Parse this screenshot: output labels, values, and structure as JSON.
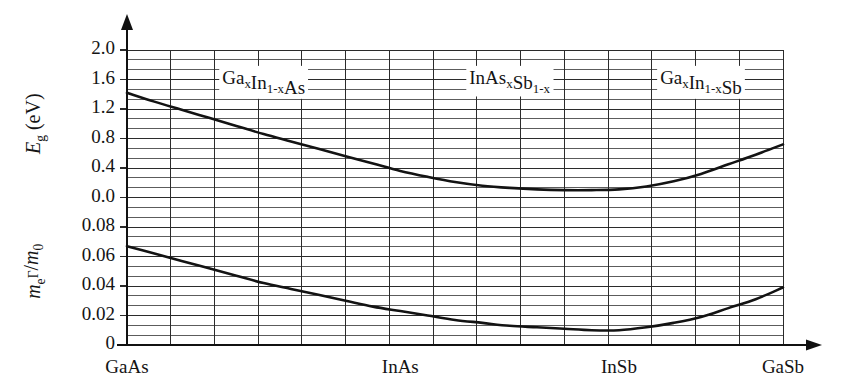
{
  "chart_data": {
    "type": "line",
    "title": "",
    "subtitle": "",
    "xlabel": "",
    "ylabel": "",
    "grid": true,
    "legend": "none",
    "x_axis": {
      "type": "composition",
      "tick_labels": [
        "GaAs",
        "InAs",
        "InSb",
        "GaSb"
      ],
      "tick_fractions": [
        0.0,
        0.4166,
        0.75,
        1.0
      ],
      "range": [
        0,
        1
      ]
    },
    "panels": [
      {
        "name": "bandgap",
        "ylabel_plain": "Eg (eV)",
        "ylabel_symbol": "E",
        "ylabel_subscript": "g",
        "ylabel_unit": "(eV)",
        "ytick_labels": [
          "2.0",
          "1.6",
          "1.2",
          "0.8",
          "0.4",
          "0.0"
        ],
        "ytick_values": [
          2.0,
          1.6,
          1.2,
          0.8,
          0.4,
          0.0
        ],
        "ylim": [
          0.0,
          2.0
        ],
        "minor_ticks_per_interval": 2,
        "series": [
          {
            "name": "Eg",
            "x": [
              0.0,
              0.0417,
              0.0833,
              0.125,
              0.1667,
              0.2083,
              0.25,
              0.2917,
              0.3333,
              0.375,
              0.4166,
              0.4583,
              0.5,
              0.5417,
              0.5833,
              0.625,
              0.6667,
              0.7083,
              0.75,
              0.7917,
              0.8333,
              0.875,
              0.9167,
              0.9583,
              1.0
            ],
            "values": [
              1.42,
              1.3,
              1.19,
              1.08,
              0.97,
              0.86,
              0.76,
              0.66,
              0.56,
              0.46,
              0.36,
              0.28,
              0.21,
              0.16,
              0.13,
              0.11,
              0.1,
              0.1,
              0.11,
              0.15,
              0.22,
              0.32,
              0.45,
              0.58,
              0.72
            ]
          }
        ]
      },
      {
        "name": "effective-mass",
        "ylabel_plain": "me(Gamma)/m0",
        "ylabel_symbol": "m",
        "ylabel_subscript": "e",
        "ylabel_superscript": "Γ",
        "ylabel_denominator": "m",
        "ylabel_denominator_subscript": "0",
        "ytick_labels": [
          "0.08",
          "0.06",
          "0.04",
          "0.02",
          "0"
        ],
        "ytick_values": [
          0.08,
          0.06,
          0.04,
          0.02,
          0.0
        ],
        "ylim": [
          0.0,
          0.1
        ],
        "minor_ticks_per_interval": 2,
        "series": [
          {
            "name": "me/m0",
            "x": [
              0.0,
              0.0417,
              0.0833,
              0.125,
              0.1667,
              0.2083,
              0.25,
              0.2917,
              0.3333,
              0.375,
              0.4166,
              0.4583,
              0.5,
              0.5417,
              0.5833,
              0.625,
              0.6667,
              0.7083,
              0.75,
              0.7917,
              0.8333,
              0.875,
              0.9167,
              0.9583,
              1.0
            ],
            "values": [
              0.067,
              0.062,
              0.057,
              0.052,
              0.047,
              0.042,
              0.038,
              0.034,
              0.03,
              0.026,
              0.023,
              0.02,
              0.017,
              0.015,
              0.013,
              0.012,
              0.011,
              0.01,
              0.01,
              0.012,
              0.015,
              0.019,
              0.025,
              0.031,
              0.039
            ]
          }
        ]
      }
    ],
    "annotations": [
      {
        "id": "alloy-1",
        "text": "GaxIn1-xAs",
        "parts": [
          {
            "t": "Ga",
            "k": "base"
          },
          {
            "t": "x",
            "k": "sub"
          },
          {
            "t": "In",
            "k": "base"
          },
          {
            "t": "1-x",
            "k": "sub"
          },
          {
            "t": "As",
            "k": "base"
          }
        ],
        "x_fraction": 0.2083,
        "y_value": 1.6,
        "panel": "bandgap"
      },
      {
        "id": "alloy-2",
        "text": "InAsxSb1-x",
        "parts": [
          {
            "t": "InAs",
            "k": "base"
          },
          {
            "t": "x",
            "k": "sub"
          },
          {
            "t": "Sb",
            "k": "base"
          },
          {
            "t": "1-x",
            "k": "sub"
          }
        ],
        "x_fraction": 0.5833,
        "y_value": 1.6,
        "panel": "bandgap"
      },
      {
        "id": "alloy-3",
        "text": "GaxIn1-xSb",
        "parts": [
          {
            "t": "Ga",
            "k": "base"
          },
          {
            "t": "x",
            "k": "sub"
          },
          {
            "t": "In",
            "k": "base"
          },
          {
            "t": "1-x",
            "k": "sub"
          },
          {
            "t": "Sb",
            "k": "base"
          }
        ],
        "x_fraction": 0.875,
        "y_value": 1.6,
        "panel": "bandgap"
      }
    ],
    "colors": {
      "curve": "#131313",
      "grid": "#2b2b2b",
      "axis": "#111111",
      "text": "#141414",
      "background": "#ffffff"
    }
  }
}
